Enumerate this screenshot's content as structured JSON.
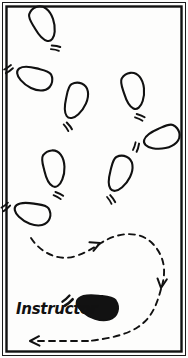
{
  "figure": {
    "caption_label": "Instructor",
    "background_color": "#fdfdfc",
    "ink_color": "#111111",
    "width": 188,
    "height": 358
  },
  "border": {
    "outer_stroke": "#1a1a1a",
    "outer_width": 1,
    "inner_stroke": "#111111",
    "inner_width": 2.4,
    "outer_rect": {
      "x": 2.5,
      "y": 2.5,
      "w": 183,
      "h": 353
    },
    "inner_rect": {
      "x": 6.5,
      "y": 6.5,
      "w": 175,
      "h": 345
    }
  },
  "legend": {
    "instructor_marker": "filled-footprint",
    "student_marker": "outline-footprint",
    "path_marker": "dashed-arrow"
  },
  "footprints": [
    {
      "id": "step-1",
      "x": 48,
      "y": 28,
      "rotation": -35,
      "scale": 1.0,
      "fill": "none",
      "note": "top-left step"
    },
    {
      "id": "step-2",
      "x": 28,
      "y": 78,
      "rotation": 100,
      "scale": 1.0,
      "fill": "none",
      "note": "upper-left step"
    },
    {
      "id": "step-3",
      "x": 76,
      "y": 107,
      "rotation": 8,
      "scale": 1.0,
      "fill": "none",
      "note": "center upper step"
    },
    {
      "id": "step-4",
      "x": 137,
      "y": 96,
      "rotation": -22,
      "scale": 1.0,
      "fill": "none",
      "note": "upper-right step"
    },
    {
      "id": "step-5",
      "x": 157,
      "y": 142,
      "rotation": 62,
      "scale": 1.0,
      "fill": "none",
      "note": "right step"
    },
    {
      "id": "step-6",
      "x": 57,
      "y": 174,
      "rotation": -18,
      "scale": 1.0,
      "fill": "none",
      "note": "mid-left step"
    },
    {
      "id": "step-7",
      "x": 120,
      "y": 180,
      "rotation": 10,
      "scale": 1.0,
      "fill": "none",
      "note": "mid-right step"
    },
    {
      "id": "step-8",
      "x": 26,
      "y": 214,
      "rotation": 95,
      "scale": 1.0,
      "fill": "none",
      "note": "lower-left step"
    },
    {
      "id": "instructor-print",
      "x": 90,
      "y": 308,
      "rotation": 92,
      "scale": 1.15,
      "fill": "solid",
      "note": "instructor position, solid black"
    }
  ],
  "paths": [
    {
      "id": "s-curve",
      "style": "dashed",
      "description": "S-shaped dashed route from lower-left footprint curving right then down the right side"
    },
    {
      "id": "bottom-return",
      "style": "dashed",
      "description": "bottom dashed return line travelling right to left"
    }
  ],
  "arrowheads": [
    {
      "id": "arrow-right-mid",
      "x": 98,
      "y": 245,
      "direction": "right",
      "rotation": -18
    },
    {
      "id": "arrow-down-right",
      "x": 161,
      "y": 285,
      "direction": "down",
      "rotation": 95
    },
    {
      "id": "arrow-left-bottom",
      "x": 30,
      "y": 341,
      "direction": "left",
      "rotation": 182
    }
  ]
}
